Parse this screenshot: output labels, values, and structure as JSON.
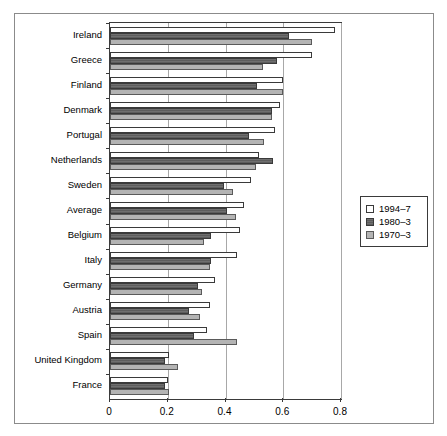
{
  "chart_data": {
    "type": "bar",
    "orientation": "horizontal",
    "title": "",
    "subtitle": "",
    "xlabel": "",
    "ylabel": "",
    "xlim": [
      0,
      0.8
    ],
    "xticks": [
      "0",
      "0.2",
      "0.4",
      "0.6",
      "0.8"
    ],
    "xtick_values": [
      0,
      0.2,
      0.4,
      0.6,
      0.8
    ],
    "grid": "vertical",
    "legend_position": "right",
    "categories": [
      "Ireland",
      "Greece",
      "Finland",
      "Denmark",
      "Portugal",
      "Netherlands",
      "Sweden",
      "Average",
      "Belgium",
      "Italy",
      "Germany",
      "Austria",
      "Spain",
      "United Kingdom",
      "France"
    ],
    "series": [
      {
        "name": "1994–7",
        "style": "open",
        "color": "#ffffff",
        "values": [
          0.78,
          0.7,
          0.6,
          0.59,
          0.57,
          0.515,
          0.49,
          0.465,
          0.45,
          0.44,
          0.365,
          0.345,
          0.335,
          0.205,
          0.2
        ]
      },
      {
        "name": "1980–3",
        "style": "dark-hatched",
        "color": "#6f6f6f",
        "values": [
          0.62,
          0.58,
          0.51,
          0.56,
          0.48,
          0.565,
          0.395,
          0.405,
          0.35,
          0.35,
          0.305,
          0.275,
          0.29,
          0.19,
          0.19
        ]
      },
      {
        "name": "1970–3",
        "style": "light-grey",
        "color": "#b4b4b4",
        "values": [
          0.7,
          0.53,
          0.6,
          0.56,
          0.535,
          0.505,
          0.425,
          0.435,
          0.325,
          0.345,
          0.32,
          0.31,
          0.44,
          0.235,
          0.205
        ]
      }
    ]
  },
  "legend": {
    "items": [
      {
        "label": "1994–7"
      },
      {
        "label": "1980–3"
      },
      {
        "label": "1970–3"
      }
    ]
  }
}
